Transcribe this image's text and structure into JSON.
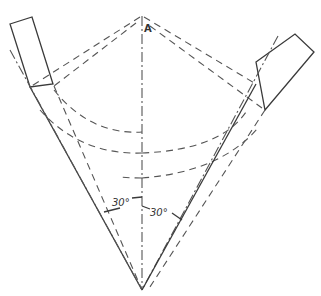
{
  "diagram": {
    "type": "geometric-construction",
    "labels": {
      "apex_point": "A",
      "angle_left": "30°",
      "angle_right": "30°"
    },
    "colors": {
      "line": "#3a3a3a",
      "background": "#ffffff"
    }
  }
}
